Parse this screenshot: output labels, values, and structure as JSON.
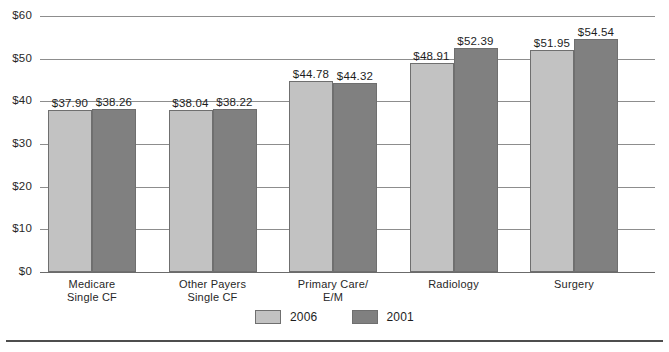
{
  "chart_data": {
    "type": "bar",
    "title": "",
    "subtitle": "",
    "xlabel": "",
    "ylabel": "",
    "ylim": [
      0,
      60
    ],
    "y_ticks": [
      "$0",
      "$10",
      "$20",
      "$30",
      "$40",
      "$50",
      "$60"
    ],
    "y_tick_values": [
      0,
      10,
      20,
      30,
      40,
      50,
      60
    ],
    "grid": true,
    "legend_position": "bottom-center",
    "value_prefix": "$",
    "categories": [
      "Medicare Single CF",
      "Other Payers Single CF",
      "Primary Care/ E/M",
      "Radiology",
      "Surgery"
    ],
    "category_lines": [
      [
        "Medicare",
        "Single CF"
      ],
      [
        "Other Payers",
        "Single CF"
      ],
      [
        "Primary Care/",
        "E/M"
      ],
      [
        "Radiology",
        ""
      ],
      [
        "Surgery",
        ""
      ]
    ],
    "series": [
      {
        "name": "2006",
        "color": "#c2c2c2",
        "values": [
          37.9,
          38.04,
          44.78,
          48.91,
          51.95
        ],
        "labels": [
          "$37.90",
          "$38.04",
          "$44.78",
          "$48.91",
          "$51.95"
        ]
      },
      {
        "name": "2001",
        "color": "#808080",
        "values": [
          38.26,
          38.22,
          44.32,
          52.39,
          54.54
        ],
        "labels": [
          "$38.26",
          "$38.22",
          "$44.32",
          "$52.39",
          "$54.54"
        ]
      }
    ]
  },
  "legend": {
    "items": [
      {
        "label": "2006",
        "color": "#c2c2c2"
      },
      {
        "label": "2001",
        "color": "#808080"
      }
    ]
  }
}
